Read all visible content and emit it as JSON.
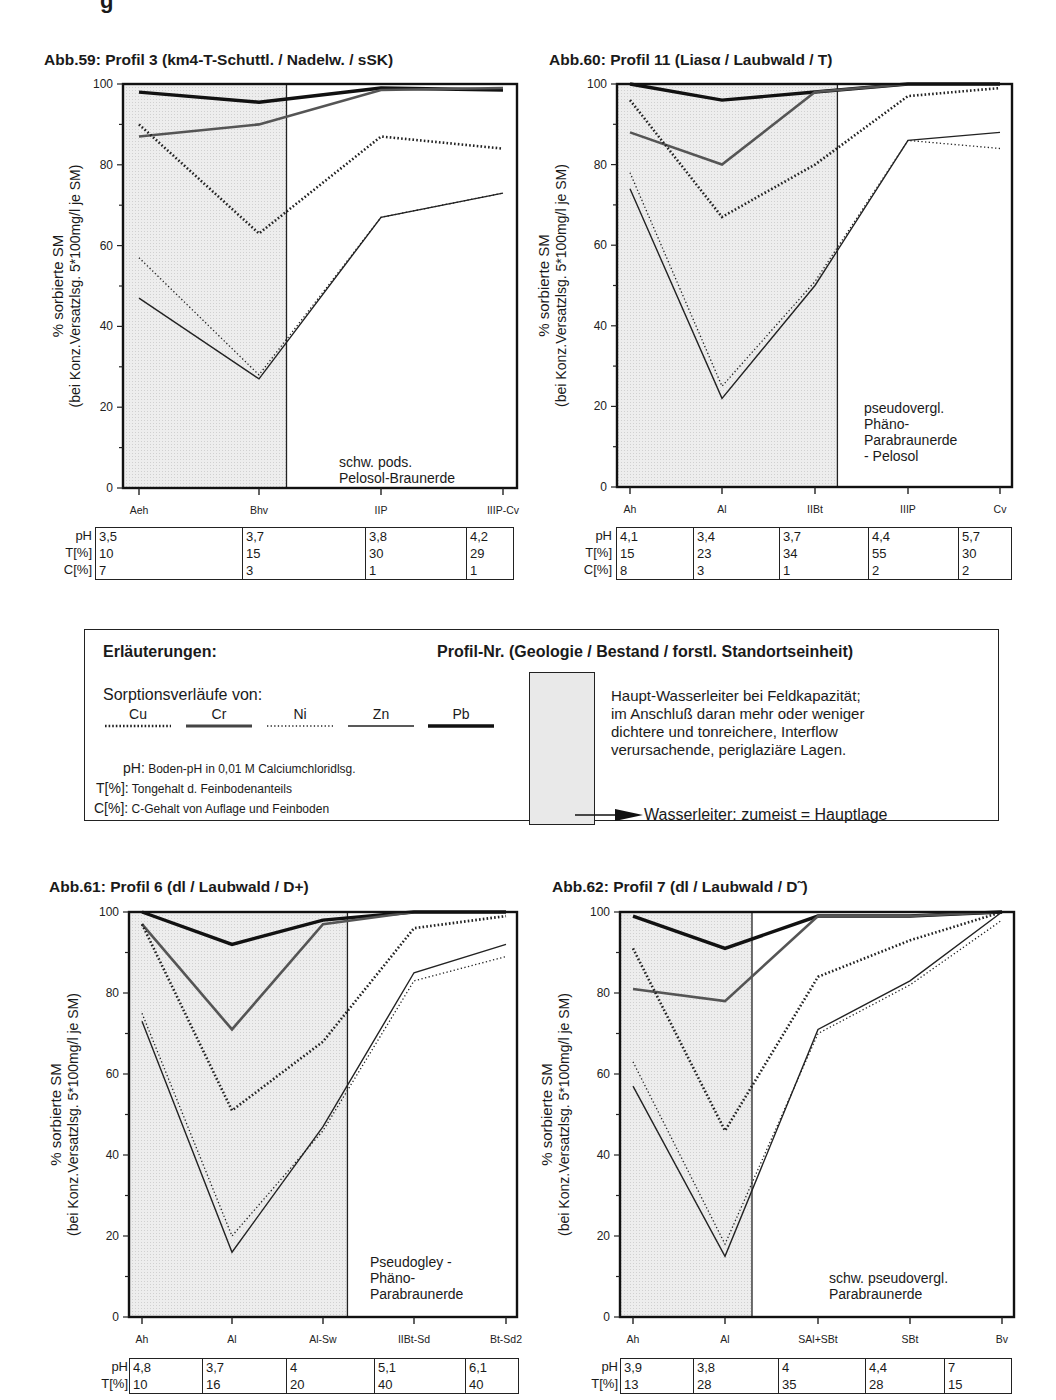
{
  "page_header_fragment": "g",
  "legend": {
    "title": "Erläuterungen:",
    "profile_key": "Profil-Nr. (Geologie / Bestand / forstl. Standortseinheit)",
    "sorption_title": "Sorptionsverläufe von:",
    "series_keys": [
      {
        "name": "Cu",
        "style": "thick-dotted"
      },
      {
        "name": "Cr",
        "style": "thick-solid-gray"
      },
      {
        "name": "Ni",
        "style": "thin-dotted"
      },
      {
        "name": "Zn",
        "style": "thin-solid"
      },
      {
        "name": "Pb",
        "style": "thick-solid"
      }
    ],
    "defs": [
      {
        "key": "pH:",
        "text": "Boden-pH in 0,01 M Calciumchloridlsg."
      },
      {
        "key": "T[%]:",
        "text": "Tongehalt d. Feinbodenanteils"
      },
      {
        "key": "C[%]:",
        "text": "C-Gehalt von Auflage und Feinboden"
      }
    ],
    "shade_desc_lines": [
      "Haupt-Wasserleiter bei Feldkapazität;",
      "im Anschluß daran mehr oder weniger",
      "dichtere und tonreichere, Interflow",
      "verursachende, periglaziäre Lagen."
    ],
    "arrow_text": "Wasserleiter: zumeist = Hauptlage"
  },
  "axis": {
    "ylabel_line1": "% sorbierte SM",
    "ylabel_line2": "(bei Konz.Versatzlsg. 5*100mg/l je SM)",
    "yticks": [
      "100",
      "80",
      "60",
      "40",
      "20",
      "0"
    ],
    "row_labels": [
      "pH",
      "T[%]",
      "C[%]"
    ]
  },
  "chart_data": [
    {
      "type": "line",
      "title": "Abb.59: Profil 3 (km4-T-Schuttl. / Nadelw. / sSK)",
      "categories": [
        "Aeh",
        "Bhv",
        "IIP",
        "IIIP-Cv"
      ],
      "ylabel": "% sorbierte SM (bei Konz.Versatzlsg. 5*100mg/l je SM)",
      "ylim": [
        0,
        100
      ],
      "soil_type": [
        "schw. pods.",
        "Pelosol-Braunerde"
      ],
      "shaded_until_fraction": 0.415,
      "series": [
        {
          "name": "Pb",
          "values": [
            98,
            95.5,
            99,
            98.5
          ]
        },
        {
          "name": "Cr",
          "values": [
            87,
            90,
            98.5,
            99
          ]
        },
        {
          "name": "Cu",
          "values": [
            90,
            63,
            87,
            84
          ]
        },
        {
          "name": "Ni",
          "values": [
            57,
            28,
            67,
            73
          ]
        },
        {
          "name": "Zn",
          "values": [
            47,
            27,
            67,
            73
          ]
        }
      ],
      "table": {
        "pH": [
          "3,5",
          "3,7",
          "3,8",
          "4,2"
        ],
        "T": [
          "10",
          "15",
          "30",
          "29"
        ],
        "C": [
          "7",
          "3",
          "1",
          "1"
        ]
      }
    },
    {
      "type": "line",
      "title": "Abb.60: Profil 11 (Liasα / Laubwald / T)",
      "categories": [
        "Ah",
        "Al",
        "IIBt",
        "IIIP",
        "Cv"
      ],
      "ylabel": "% sorbierte SM (bei Konz.Versatzlsg. 5*100mg/l je SM)",
      "ylim": [
        0,
        100
      ],
      "soil_type": [
        "pseudovergl.",
        "Phäno-",
        "Parabraunerde",
        "- Pelosol"
      ],
      "shaded_until_fraction": 0.558,
      "series": [
        {
          "name": "Pb",
          "values": [
            100,
            96,
            98,
            100,
            100
          ]
        },
        {
          "name": "Cr",
          "values": [
            88,
            80,
            98,
            100,
            100
          ]
        },
        {
          "name": "Cu",
          "values": [
            96,
            67,
            80,
            97,
            99
          ]
        },
        {
          "name": "Ni",
          "values": [
            78,
            25,
            51,
            86,
            84
          ]
        },
        {
          "name": "Zn",
          "values": [
            74,
            22,
            50,
            86,
            88
          ]
        }
      ],
      "table": {
        "pH": [
          "4,1",
          "3,4",
          "3,7",
          "4,4",
          "5,7"
        ],
        "T": [
          "15",
          "23",
          "34",
          "55",
          "30"
        ],
        "C": [
          "8",
          "3",
          "1",
          "2",
          "2"
        ]
      }
    },
    {
      "type": "line",
      "title": "Abb.61: Profil 6 (dl / Laubwald / D+)",
      "categories": [
        "Ah",
        "Al",
        "Al-Sw",
        "IIBt-Sd",
        "Bt-Sd2"
      ],
      "ylabel": "% sorbierte SM (bei Konz.Versatzlsg. 5*100mg/l je SM)",
      "ylim": [
        0,
        100
      ],
      "soil_type": [
        "Pseudogley -",
        "Phäno-",
        "Parabraunerde"
      ],
      "shaded_until_fraction": 0.563,
      "series": [
        {
          "name": "Pb",
          "values": [
            100,
            92,
            98,
            100,
            100
          ]
        },
        {
          "name": "Cr",
          "values": [
            97,
            71,
            97,
            100,
            100
          ]
        },
        {
          "name": "Cu",
          "values": [
            97,
            51,
            68,
            96,
            99
          ]
        },
        {
          "name": "Ni",
          "values": [
            75,
            20,
            46,
            83,
            89
          ]
        },
        {
          "name": "Zn",
          "values": [
            73,
            16,
            47,
            85,
            92
          ]
        }
      ],
      "table": {
        "pH": [
          "4,8",
          "3,7",
          "4",
          "5,1",
          "6,1"
        ],
        "T": [
          "10",
          "16",
          "20",
          "40",
          "40"
        ],
        "C": []
      }
    },
    {
      "type": "line",
      "title": "Abb.62: Profil 7 (dl / Laubwald / D˜)",
      "categories": [
        "Ah",
        "Al",
        "SAl+SBt",
        "SBt",
        "Bv"
      ],
      "ylabel": "% sorbierte SM (bei Konz.Versatzlsg. 5*100mg/l je SM)",
      "ylim": [
        0,
        100
      ],
      "soil_type": [
        "schw. pseudovergl.",
        "Parabraunerde"
      ],
      "shaded_until_fraction": 0.335,
      "series": [
        {
          "name": "Pb",
          "values": [
            99,
            91,
            99,
            99,
            100
          ]
        },
        {
          "name": "Cr",
          "values": [
            81,
            78,
            99,
            99,
            100
          ]
        },
        {
          "name": "Cu",
          "values": [
            91,
            46,
            84,
            93,
            100
          ]
        },
        {
          "name": "Ni",
          "values": [
            63,
            18,
            70,
            82,
            98
          ]
        },
        {
          "name": "Zn",
          "values": [
            57,
            15,
            71,
            83,
            100
          ]
        }
      ],
      "table": {
        "pH": [
          "3,9",
          "3,8",
          "4",
          "4,4",
          "7"
        ],
        "T": [
          "13",
          "28",
          "35",
          "28",
          "15"
        ],
        "C": []
      }
    }
  ]
}
